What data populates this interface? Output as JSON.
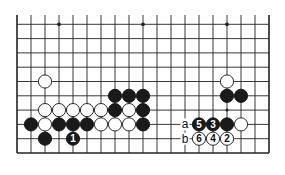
{
  "diagram": {
    "type": "go-board-fragment",
    "columns": 19,
    "rows_visible": 10,
    "edge": "bottom",
    "colors": {
      "line": "#222222",
      "black_stone": "#1a1a1a",
      "white_stone": "#ffffff",
      "background": "#ffffff"
    },
    "star_points": [
      {
        "col": 3,
        "row": 0
      },
      {
        "col": 9,
        "row": 0
      },
      {
        "col": 15,
        "row": 0
      }
    ],
    "stones": [
      {
        "color": "white",
        "col": 2,
        "row": 4
      },
      {
        "color": "white",
        "col": 15,
        "row": 4
      },
      {
        "color": "black",
        "col": 7,
        "row": 5
      },
      {
        "color": "black",
        "col": 8,
        "row": 5
      },
      {
        "color": "black",
        "col": 9,
        "row": 5
      },
      {
        "color": "black",
        "col": 15,
        "row": 5
      },
      {
        "color": "black",
        "col": 16,
        "row": 5
      },
      {
        "color": "white",
        "col": 2,
        "row": 6
      },
      {
        "color": "white",
        "col": 3,
        "row": 6
      },
      {
        "color": "white",
        "col": 4,
        "row": 6
      },
      {
        "color": "white",
        "col": 5,
        "row": 6
      },
      {
        "color": "white",
        "col": 6,
        "row": 6
      },
      {
        "color": "black",
        "col": 7,
        "row": 6
      },
      {
        "color": "white",
        "col": 8,
        "row": 6
      },
      {
        "color": "black",
        "col": 9,
        "row": 6
      },
      {
        "color": "black",
        "col": 1,
        "row": 7
      },
      {
        "color": "white",
        "col": 2,
        "row": 7
      },
      {
        "color": "black",
        "col": 3,
        "row": 7
      },
      {
        "color": "black",
        "col": 4,
        "row": 7
      },
      {
        "color": "black",
        "col": 5,
        "row": 7
      },
      {
        "color": "white",
        "col": 6,
        "row": 7
      },
      {
        "color": "white",
        "col": 7,
        "row": 7
      },
      {
        "color": "white",
        "col": 8,
        "row": 7
      },
      {
        "color": "black",
        "col": 9,
        "row": 7
      },
      {
        "color": "black",
        "col": 13,
        "row": 7,
        "label": "5"
      },
      {
        "color": "black",
        "col": 14,
        "row": 7,
        "label": "3"
      },
      {
        "color": "black",
        "col": 15,
        "row": 7
      },
      {
        "color": "white",
        "col": 16,
        "row": 7
      },
      {
        "color": "black",
        "col": 2,
        "row": 8
      },
      {
        "color": "black",
        "col": 4,
        "row": 8,
        "label": "1"
      },
      {
        "color": "white",
        "col": 13,
        "row": 8,
        "label": "6"
      },
      {
        "color": "white",
        "col": 14,
        "row": 8,
        "label": "4"
      },
      {
        "color": "white",
        "col": 15,
        "row": 8,
        "label": "2"
      }
    ],
    "markers": [
      {
        "type": "dot",
        "col": 15,
        "row": 6
      }
    ],
    "point_labels": [
      {
        "text": "a",
        "col": 12,
        "row": 7
      },
      {
        "text": "b",
        "col": 12,
        "row": 8
      }
    ]
  }
}
